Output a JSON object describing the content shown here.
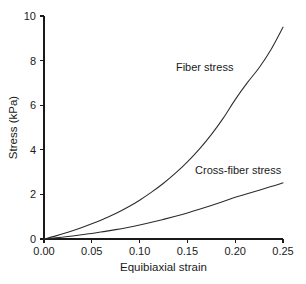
{
  "figure": {
    "background_color": "#ffffff",
    "line_color": "#2b2b2b",
    "text_color": "#1a1a1a"
  },
  "chart_data": {
    "type": "line",
    "title": "",
    "xlabel": "Equibiaxial strain",
    "ylabel": "Stress (kPa)",
    "xlim": [
      0.0,
      0.25
    ],
    "ylim": [
      0,
      10
    ],
    "grid": false,
    "legend_position": "inline-annotation",
    "xticks": [
      0.0,
      0.05,
      0.1,
      0.15,
      0.2,
      0.25
    ],
    "xticklabels": [
      "0.00",
      "0.05",
      "0.10",
      "0.15",
      "0.20",
      "0.25"
    ],
    "yticks": [
      0,
      2,
      4,
      6,
      8,
      10
    ],
    "yticklabels": [
      "0",
      "2",
      "4",
      "6",
      "8",
      "10"
    ],
    "series": [
      {
        "name": "Fiber stress",
        "label_position": {
          "x": 0.138,
          "y": 7.55
        },
        "x": [
          0.0,
          0.0125,
          0.025,
          0.0375,
          0.05,
          0.0625,
          0.075,
          0.0875,
          0.1,
          0.1125,
          0.125,
          0.1375,
          0.15,
          0.1625,
          0.175,
          0.1875,
          0.2,
          0.2125,
          0.225,
          0.2375,
          0.25
        ],
        "y": [
          0.0,
          0.14,
          0.3,
          0.48,
          0.68,
          0.9,
          1.14,
          1.42,
          1.74,
          2.1,
          2.5,
          2.95,
          3.46,
          4.03,
          4.68,
          5.42,
          6.25,
          7.0,
          7.68,
          8.5,
          9.5
        ]
      },
      {
        "name": "Cross-fiber stress",
        "label_position": {
          "x": 0.158,
          "y": 2.93
        },
        "x": [
          0.0,
          0.0125,
          0.025,
          0.0375,
          0.05,
          0.0625,
          0.075,
          0.0875,
          0.1,
          0.1125,
          0.125,
          0.1375,
          0.15,
          0.1625,
          0.175,
          0.1875,
          0.2,
          0.2125,
          0.225,
          0.2375,
          0.25
        ],
        "y": [
          0.0,
          0.05,
          0.11,
          0.18,
          0.25,
          0.33,
          0.42,
          0.52,
          0.63,
          0.75,
          0.88,
          1.02,
          1.17,
          1.33,
          1.5,
          1.68,
          1.87,
          2.03,
          2.19,
          2.35,
          2.52
        ]
      }
    ]
  },
  "axes": {
    "x_axis_title": "Equibiaxial strain",
    "y_axis_title": "Stress (kPa)"
  }
}
